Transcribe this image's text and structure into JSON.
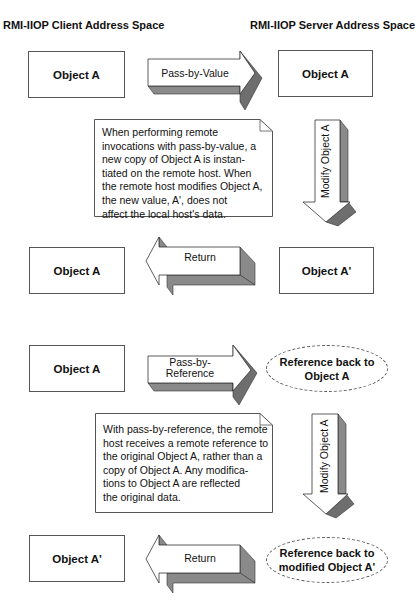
{
  "headers": {
    "client": "RMI-IIOP Client Address Space",
    "server": "RMI-IIOP Server Address Space"
  },
  "pass_by_value": {
    "client_object": "Object A",
    "forward_arrow": "Pass-by-Value",
    "server_object": "Object A",
    "note_lines": [
      "When performing remote",
      "invocations with pass-by-value, a",
      "new copy of Object A is instan-",
      "tiated on the remote host. When",
      "the remote host modifies Object A,",
      "the new value, A', does not",
      "affect the local host's data."
    ],
    "modify_arrow": "Modify Object A",
    "return_client_object": "Object A",
    "return_arrow": "Return",
    "return_server_object": "Object A'"
  },
  "pass_by_reference": {
    "client_object": "Object A",
    "forward_arrow_line1": "Pass-by-",
    "forward_arrow_line2": "Reference",
    "server_reference_line1": "Reference back to",
    "server_reference_line2": "Object A",
    "note_lines": [
      "With pass-by-reference, the remote",
      "host receives a remote reference to",
      "the original Object A, rather than a",
      "copy of Object A.  Any modifica-",
      "tions to Object A are reflected",
      "the original data."
    ],
    "modify_arrow": "Modify Object A",
    "return_client_object": "Object A'",
    "return_arrow": "Return",
    "return_server_reference_line1": "Reference back to",
    "return_server_reference_line2": "modified Object A'"
  },
  "colors": {
    "outline": "#555555",
    "arrow_face": "#ffffff",
    "arrow_shadow": "#8a8a8a",
    "arrow_shadow_dark": "#6e6e6e"
  }
}
